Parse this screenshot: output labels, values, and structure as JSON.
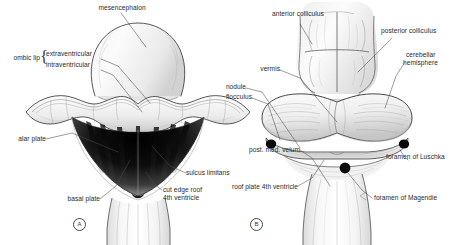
{
  "figure": {
    "ink_color": "#2a2a2a",
    "paper_color": "#ffffff",
    "panels": [
      {
        "tag": "A",
        "name": "panel-a",
        "description": "Dorsal view of embryonic hindbrain with rhombic lips, alar and basal plates, and open roof of fourth ventricle"
      },
      {
        "tag": "B",
        "name": "panel-b",
        "description": "Dorsal view of later cerebellum showing vermis, hemispheres, colliculi and foramina of the fourth ventricle"
      }
    ]
  },
  "panel_a": {
    "tag": "A",
    "labels": {
      "mesencephalon": "mesencephalon",
      "rhombic_lip": "ombic lip",
      "extraventricular": "extraventricular",
      "intraventricular": "intraventricular",
      "alar_plate": "alar plate",
      "basal_plate": "basal plate",
      "sulcus_limitans": "sulcus limitans",
      "cut_edge_roof_line1": "cut edge roof",
      "cut_edge_roof_line2": "4th ventricle"
    }
  },
  "panel_b": {
    "tag": "B",
    "labels": {
      "anterior_colliculus": "anterior colliculus",
      "posterior_colliculus": "posterior colliculus",
      "cerebellar_hemisphere_line1": "cerebellar",
      "cerebellar_hemisphere_line2": "hemisphere",
      "vermis": "vermis",
      "nodule": "nodule",
      "flocculus": "flocculus",
      "post_med_velum": "post. med. velum",
      "roof_plate_4th_ventricle": "roof plate 4th ventricle",
      "foramen_of_luschka": "foramen of Luschka",
      "foramen_of_magendie": "foramen of Magendie"
    }
  }
}
